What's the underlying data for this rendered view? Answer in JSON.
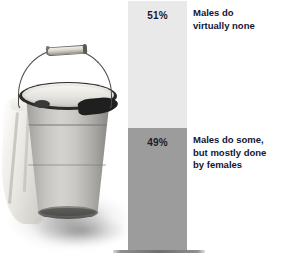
{
  "chart_data": {
    "type": "bar",
    "orientation": "vertical-stacked",
    "title": "",
    "subtitle": "",
    "xlabel": "",
    "ylabel": "",
    "ylim": [
      0,
      100
    ],
    "grid": false,
    "legend_position": "right-inline",
    "categories": [
      "Household cleaning task share"
    ],
    "series": [
      {
        "name": "Males do virtually none",
        "values": [
          51
        ],
        "value_label": "51%",
        "color": "#e9e9e9",
        "position": "top"
      },
      {
        "name": "Males do some, but mostly done by females",
        "values": [
          49
        ],
        "value_label": "49%",
        "color": "#9c9c9c",
        "position": "bottom"
      }
    ],
    "annotations": [
      "Males do virtually none",
      "Males do some, but mostly done by females"
    ]
  },
  "photo": {
    "subject": "metal bucket with cloth",
    "alt": "Grayscale photograph of a galvanized metal bucket with a wire handle and a white cloth draped over its rim"
  },
  "bar": {
    "top_segment": {
      "percent_label": "51%",
      "color": "#e9e9e9"
    },
    "bottom_segment": {
      "percent_label": "49%",
      "color": "#9c9c9c"
    },
    "baseline_color": "#6f6f6f"
  },
  "annotations": {
    "top": {
      "lines": [
        "Males do",
        "virtually none"
      ]
    },
    "bottom": {
      "lines": [
        "Males do some,",
        "but mostly done",
        "by females"
      ]
    }
  }
}
